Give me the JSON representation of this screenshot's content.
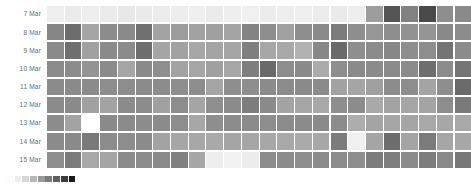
{
  "chart_data": {
    "type": "heatmap",
    "title": "",
    "xlabel": "",
    "ylabel": "",
    "grid": false,
    "legend_position": "bottom-left",
    "colormap": "grayscale-light-to-dark",
    "value_range": [
      0,
      100
    ],
    "columns": 24,
    "x": [
      "1",
      "2",
      "3",
      "4",
      "5",
      "6",
      "7",
      "8",
      "9",
      "10",
      "11",
      "12",
      "13",
      "14",
      "15",
      "16",
      "17",
      "18",
      "19",
      "20",
      "21",
      "22",
      "23",
      "24"
    ],
    "categories": [
      "7 Mar",
      "8 Mar",
      "9 Mar",
      "10 Mar",
      "11 Mar",
      "12 Mar",
      "13 Mar",
      "14 Mar",
      "15 Mar"
    ],
    "legend": {
      "swatches": [
        "#fbfbfb",
        "#ededed",
        "#d6d6d6",
        "#b6b6b6",
        "#989898",
        "#7b7b7b",
        "#5e5e5e",
        "#3d3d3d",
        "#1a1a1a"
      ],
      "labels": []
    },
    "rows": [
      {
        "label": "7 Mar",
        "colors": [
          "#efefef",
          "#ebebeb",
          "#eeeeee",
          "#ebebeb",
          "#e8e8e8",
          "#eaeaea",
          "#ececec",
          "#ededed",
          "#efefef",
          "#ebebeb",
          "#eeeeee",
          "#f0f0f0",
          "#ececec",
          "#eeeeee",
          "#efefef",
          "#ececec",
          "#eaeaea",
          "#eeeeee",
          "#9d9d9d",
          "#555555",
          "#828282",
          "#4a4a4a",
          "#8e8e8e",
          "#8a8a8a"
        ],
        "values": [
          6,
          7,
          6,
          7,
          8,
          7,
          7,
          7,
          6,
          7,
          6,
          6,
          7,
          6,
          6,
          7,
          8,
          6,
          38,
          66,
          49,
          70,
          44,
          46
        ]
      },
      {
        "label": "8 Mar",
        "colors": [
          "#868686",
          "#6d6d6d",
          "#a5a5a5",
          "#8c8c8c",
          "#8a8a8a",
          "#707070",
          "#a3a3a3",
          "#9d9d9d",
          "#a2a2a2",
          "#a0a0a0",
          "#a4a4a4",
          "#838383",
          "#8e8e8e",
          "#a1a1a1",
          "#8d8d8d",
          "#8a8a8a",
          "#7c7c7c",
          "#8e8e8e",
          "#969696",
          "#8e8e8e",
          "#929292",
          "#959595",
          "#898989",
          "#8c8c8c"
        ],
        "values": [
          47,
          58,
          36,
          45,
          46,
          56,
          37,
          38,
          37,
          38,
          36,
          48,
          44,
          37,
          45,
          46,
          51,
          44,
          41,
          44,
          43,
          42,
          46,
          45
        ]
      },
      {
        "label": "9 Mar",
        "colors": [
          "#8a8a8a",
          "#6f6f6f",
          "#a1a1a1",
          "#8a8a8a",
          "#8b8b8b",
          "#6d6d6d",
          "#a5a5a5",
          "#a2a2a2",
          "#a7a7a7",
          "#a4a4a4",
          "#a5a5a5",
          "#7f7f7f",
          "#a7a7a7",
          "#a8a8a8",
          "#b1b1b1",
          "#888888",
          "#6a6a6a",
          "#8e8e8e",
          "#8b8b8b",
          "#878787",
          "#8e8e8e",
          "#8d8d8d",
          "#747474",
          "#8b8b8b"
        ],
        "values": [
          46,
          57,
          38,
          46,
          45,
          58,
          36,
          37,
          34,
          36,
          36,
          50,
          34,
          34,
          30,
          46,
          60,
          44,
          45,
          47,
          44,
          44,
          55,
          45
        ]
      },
      {
        "label": "10 Mar",
        "colors": [
          "#8c8c8c",
          "#8c8c8c",
          "#949494",
          "#8b8b8b",
          "#a6a6a6",
          "#8a8a8a",
          "#8f8f8f",
          "#a3a3a3",
          "#a6a6a6",
          "#a0a0a0",
          "#a7a7a7",
          "#7e7e7e",
          "#6a6a6a",
          "#8d8d8d",
          "#8a8a8a",
          "#ababab",
          "#8d8d8d",
          "#8a8a8a",
          "#8b8b8b",
          "#8b8b8b",
          "#8b8b8b",
          "#6e6e6e",
          "#8c8c8c",
          "#757575"
        ],
        "values": [
          45,
          45,
          41,
          45,
          35,
          46,
          43,
          37,
          35,
          38,
          34,
          51,
          60,
          44,
          46,
          33,
          44,
          46,
          45,
          45,
          45,
          58,
          45,
          54
        ]
      },
      {
        "label": "11 Mar",
        "colors": [
          "#8b8b8b",
          "#8a8a8a",
          "#8b8b8b",
          "#8d8d8d",
          "#8d8d8d",
          "#8b8b8b",
          "#8c8c8c",
          "#8e8e8e",
          "#8d8d8d",
          "#a5a5a5",
          "#8e8e8e",
          "#8e8e8e",
          "#8b8b8b",
          "#8c8c8c",
          "#8a8a8a",
          "#8b8b8b",
          "#a2a2a2",
          "#a5a5a5",
          "#a0a0a0",
          "#8c8c8c",
          "#8d8d8d",
          "#a4a4a4",
          "#8e8e8e",
          "#6b6b6b"
        ],
        "values": [
          45,
          46,
          45,
          44,
          44,
          45,
          45,
          43,
          44,
          36,
          43,
          43,
          45,
          45,
          46,
          45,
          37,
          36,
          38,
          45,
          44,
          36,
          43,
          59
        ]
      },
      {
        "label": "12 Mar",
        "colors": [
          "#8b8b8b",
          "#8a8a8a",
          "#a1a1a1",
          "#a3a3a3",
          "#8b8b8b",
          "#8c8c8c",
          "#a1a1a1",
          "#8d8d8d",
          "#a5a5a5",
          "#8f8f8f",
          "#8b8b8b",
          "#7d7d7d",
          "#8a8a8a",
          "#a3a3a3",
          "#a6a6a6",
          "#a8a8a8",
          "#8e8e8e",
          "#8c8c8c",
          "#a9a9a9",
          "#a3a3a3",
          "#a6a6a6",
          "#a4a4a4",
          "#8d8d8d",
          "#7a7a7a"
        ],
        "values": [
          45,
          46,
          38,
          37,
          45,
          45,
          38,
          44,
          36,
          43,
          45,
          52,
          46,
          37,
          35,
          34,
          43,
          45,
          33,
          37,
          35,
          36,
          44,
          53
        ]
      },
      {
        "label": "13 Mar",
        "colors": [
          "#8c8c8c",
          "#a3a3a3",
          "#ffffff",
          "#8a8a8a",
          "#8b8b8b",
          "#8c8c8c",
          "#8b8b8b",
          "#8d8d8d",
          "#a7a7a7",
          "#8e8e8e",
          "#8c8c8c",
          "#8b8b8b",
          "#8d8d8d",
          "#8c8c8c",
          "#8b8b8b",
          "#8a8a8a",
          "#8c8c8c",
          "#adadad",
          "#a4a4a4",
          "#a6a6a6",
          "#a5a5a5",
          "#a8a8a8",
          "#a7a7a7",
          "#a9a9a9"
        ],
        "values": [
          45,
          37,
          0,
          46,
          45,
          45,
          45,
          44,
          34,
          43,
          45,
          45,
          44,
          45,
          45,
          46,
          45,
          31,
          36,
          35,
          36,
          34,
          34,
          33
        ]
      },
      {
        "label": "14 Mar",
        "colors": [
          "#8b8b8b",
          "#8a8a8a",
          "#7a7a7a",
          "#8c8c8c",
          "#8d8d8d",
          "#8b8b8b",
          "#a3a3a3",
          "#a6a6a6",
          "#a7a7a7",
          "#a9a9a9",
          "#a5a5a5",
          "#a6a6a6",
          "#a7a7a7",
          "#a8a8a8",
          "#aaaaaa",
          "#a7a7a7",
          "#7c7c7c",
          "#f0f0f0",
          "#a5a5a5",
          "#6d6d6d",
          "#a4a4a4",
          "#7b7b7b",
          "#a6a6a6",
          "#a7a7a7"
        ],
        "values": [
          45,
          46,
          53,
          45,
          44,
          45,
          37,
          35,
          34,
          33,
          36,
          35,
          34,
          34,
          32,
          34,
          52,
          6,
          36,
          58,
          36,
          52,
          35,
          34
        ]
      },
      {
        "label": "15 Mar",
        "colors": [
          "#8d8d8d",
          "#7b7b7b",
          "#a8a8a8",
          "#a5a5a5",
          "#8b8b8b",
          "#8c8c8c",
          "#8a8a8a",
          "#808080",
          "#a6a6a6",
          "#eeeeee",
          "#f2f2f2",
          "#ececec",
          "#8c8c8c",
          "#8b8b8b",
          "#8d8d8d",
          "#8b8b8b",
          "#8c8c8c",
          "#8e8e8e",
          "#7c7c7c",
          "#7e7e7e",
          "#8b8b8b",
          "#7d7d7d",
          "#8a8a8a",
          "#787878"
        ],
        "values": [
          44,
          52,
          34,
          36,
          45,
          45,
          46,
          50,
          35,
          7,
          6,
          7,
          45,
          45,
          44,
          45,
          45,
          43,
          51,
          50,
          45,
          51,
          46,
          53
        ]
      }
    ]
  }
}
